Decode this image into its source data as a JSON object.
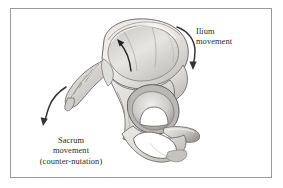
{
  "figure": {
    "name": "pelvic-bone-movement-illustration",
    "background_color": "#ffffff",
    "border_color": "#9a9a9a",
    "text_color": "#2b2b2b"
  },
  "labels": {
    "ilium": {
      "line1": "Ilium",
      "line2": "movement"
    },
    "sacrum": {
      "line1": "Sacrum",
      "line2": "movement",
      "line3": "(counter-nutation)"
    }
  },
  "arrows": [
    {
      "name": "ilium-movement-arrow",
      "description": "curved arrow sweeping down the outer right edge of the ilium",
      "color": "#333333"
    },
    {
      "name": "ilium-internal-arrow",
      "description": "straight-curved arrow inside the iliac fossa pointing up and left",
      "color": "#222222"
    },
    {
      "name": "sacrum-movement-arrow",
      "description": "curved arrow at lower left pointing down and left",
      "color": "#333333"
    }
  ],
  "anatomy": {
    "bone_fill_light": "#f2f1ef",
    "bone_fill_mid": "#d8d7d4",
    "bone_fill_dark": "#a9a8a5",
    "bone_outline": "#6f6e6c",
    "parts": [
      "iliac-crest",
      "iliac-fossa",
      "sacrum",
      "coccyx",
      "acetabulum",
      "obturator-foramen",
      "ischial-tuberosity",
      "pubic-ramus"
    ]
  }
}
